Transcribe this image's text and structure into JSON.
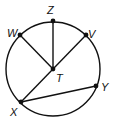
{
  "diagram": {
    "type": "circle-geometry",
    "circle": {
      "center": "T",
      "cx": 53,
      "cy": 69,
      "r": 47
    },
    "points": [
      {
        "id": "Z",
        "label": "Z",
        "x": 53,
        "y": 21,
        "lx": 49,
        "ly": 14
      },
      {
        "id": "W",
        "label": "W",
        "x": 20,
        "y": 35,
        "lx": 8,
        "ly": 35
      },
      {
        "id": "V",
        "label": "V",
        "x": 86,
        "y": 35,
        "lx": 89,
        "ly": 37
      },
      {
        "id": "T",
        "label": "T",
        "x": 53,
        "y": 69,
        "lx": 57,
        "ly": 82
      },
      {
        "id": "X",
        "label": "X",
        "x": 21,
        "y": 102,
        "lx": 10,
        "ly": 115
      },
      {
        "id": "Y",
        "label": "Y",
        "x": 96,
        "y": 86,
        "lx": 101,
        "ly": 91
      }
    ],
    "segments": [
      [
        "T",
        "Z"
      ],
      [
        "T",
        "W"
      ],
      [
        "V",
        "X"
      ],
      [
        "X",
        "Y"
      ]
    ]
  }
}
